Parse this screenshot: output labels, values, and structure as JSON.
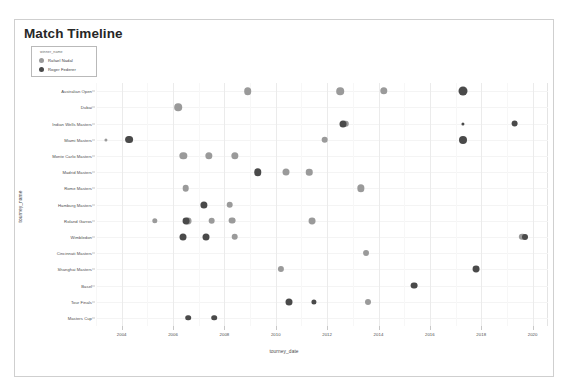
{
  "title": "Match Timeline",
  "legend": {
    "title": "winner_name",
    "entries": [
      {
        "label": "Rafael Nadal",
        "color": "#9a9a9a"
      },
      {
        "label": "Roger Federer",
        "color": "#4a4a4a"
      }
    ]
  },
  "chart_data": {
    "type": "scatter",
    "title": "Match Timeline",
    "xlabel": "tourney_date",
    "ylabel": "tourney_name",
    "grid": true,
    "legend_position": "top-left",
    "legend_title": "winner_name",
    "xlim": [
      2003.0,
      2020.6
    ],
    "xticks": [
      2004,
      2006,
      2008,
      2010,
      2012,
      2014,
      2016,
      2018,
      2020
    ],
    "xtick_labels": [
      "2004",
      "2006",
      "2008",
      "2010",
      "2012",
      "2014",
      "2016",
      "2018",
      "2020"
    ],
    "categories": [
      "Australian Open",
      "Dubai",
      "Indian Wells Masters",
      "Miami Masters",
      "Monte Carlo Masters",
      "Madrid Masters",
      "Rome Masters",
      "Hamburg Masters",
      "Roland Garros",
      "Wimbledon",
      "Cincinnati Masters",
      "Shanghai Masters",
      "Basel",
      "Tour Finals",
      "Masters Cup"
    ],
    "series": [
      {
        "name": "Rafael Nadal",
        "color": "#9a9a9a",
        "points": [
          {
            "x": 2008.9,
            "y": "Australian Open",
            "size": 7.6
          },
          {
            "x": 2012.5,
            "y": "Australian Open",
            "size": 7.6
          },
          {
            "x": 2014.2,
            "y": "Australian Open",
            "size": 7.4
          },
          {
            "x": 2006.2,
            "y": "Dubai",
            "size": 7.6
          },
          {
            "x": 2012.7,
            "y": "Indian Wells Masters",
            "size": 6.4
          },
          {
            "x": 2003.4,
            "y": "Miami Masters",
            "size": 3.2
          },
          {
            "x": 2011.9,
            "y": "Miami Masters",
            "size": 6.7
          },
          {
            "x": 2006.4,
            "y": "Monte Carlo Masters",
            "size": 7.3
          },
          {
            "x": 2007.4,
            "y": "Monte Carlo Masters",
            "size": 7.3
          },
          {
            "x": 2008.4,
            "y": "Monte Carlo Masters",
            "size": 7.3
          },
          {
            "x": 2010.4,
            "y": "Madrid Masters",
            "size": 7.0
          },
          {
            "x": 2011.3,
            "y": "Madrid Masters",
            "size": 6.5
          },
          {
            "x": 2006.5,
            "y": "Rome Masters",
            "size": 6.6
          },
          {
            "x": 2013.3,
            "y": "Rome Masters",
            "size": 7.3
          },
          {
            "x": 2008.2,
            "y": "Hamburg Masters",
            "size": 6.6
          },
          {
            "x": 2005.3,
            "y": "Roland Garros",
            "size": 5.4
          },
          {
            "x": 2006.6,
            "y": "Roland Garros",
            "size": 6.9
          },
          {
            "x": 2007.5,
            "y": "Roland Garros",
            "size": 6.7
          },
          {
            "x": 2008.3,
            "y": "Roland Garros",
            "size": 6.8
          },
          {
            "x": 2011.4,
            "y": "Roland Garros",
            "size": 6.9
          },
          {
            "x": 2008.4,
            "y": "Wimbledon",
            "size": 6.6
          },
          {
            "x": 2019.6,
            "y": "Wimbledon",
            "size": 6.3
          },
          {
            "x": 2013.5,
            "y": "Cincinnati Masters",
            "size": 5.9
          },
          {
            "x": 2010.2,
            "y": "Shanghai Masters",
            "size": 6.2
          },
          {
            "x": 2013.6,
            "y": "Tour Finals",
            "size": 6.0
          }
        ]
      },
      {
        "name": "Roger Federer",
        "color": "#4a4a4a",
        "points": [
          {
            "x": 2017.3,
            "y": "Australian Open",
            "size": 9.0
          },
          {
            "x": 2012.6,
            "y": "Indian Wells Masters",
            "size": 7.0
          },
          {
            "x": 2017.3,
            "y": "Indian Wells Masters",
            "size": 3.2
          },
          {
            "x": 2019.3,
            "y": "Indian Wells Masters",
            "size": 6.8
          },
          {
            "x": 2004.3,
            "y": "Miami Masters",
            "size": 7.8
          },
          {
            "x": 2017.3,
            "y": "Miami Masters",
            "size": 8.0
          },
          {
            "x": 2009.3,
            "y": "Madrid Masters",
            "size": 7.5
          },
          {
            "x": 2007.2,
            "y": "Hamburg Masters",
            "size": 7.2
          },
          {
            "x": 2006.5,
            "y": "Roland Garros",
            "size": 6.9
          },
          {
            "x": 2007.3,
            "y": "Wimbledon",
            "size": 7.0
          },
          {
            "x": 2006.4,
            "y": "Wimbledon",
            "size": 7.0
          },
          {
            "x": 2019.7,
            "y": "Wimbledon",
            "size": 6.0
          },
          {
            "x": 2015.4,
            "y": "Basel",
            "size": 6.8
          },
          {
            "x": 2017.8,
            "y": "Shanghai Masters",
            "size": 6.9
          },
          {
            "x": 2010.5,
            "y": "Tour Finals",
            "size": 7.0
          },
          {
            "x": 2011.5,
            "y": "Tour Finals",
            "size": 5.2
          },
          {
            "x": 2006.6,
            "y": "Masters Cup",
            "size": 5.6
          },
          {
            "x": 2007.6,
            "y": "Masters Cup",
            "size": 5.6
          }
        ]
      }
    ]
  }
}
